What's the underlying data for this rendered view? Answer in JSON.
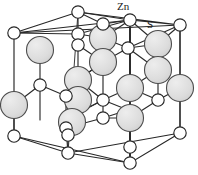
{
  "figure": {
    "name": "zinc-sulfide-wurtzite-unit-cell",
    "labels": {
      "cation": "Zn",
      "anion": "S"
    },
    "colors": {
      "edge": "#262626",
      "anion_fill": "#ffffff",
      "anion_stroke": "#262626",
      "cation_fill": "#d9d9d9",
      "cation_stroke": "#4d4d4d",
      "background": "#ffffff"
    },
    "geometry": {
      "anion_radius": 6.2,
      "cation_radius": 13.5,
      "cell_corners": {
        "top_back_left": [
          78,
          12
        ],
        "top_back_right": [
          130,
          20
        ],
        "top_front_left": [
          14,
          33
        ],
        "top_front_right": [
          180,
          25
        ],
        "bottom_back_left": [
          68,
          153
        ],
        "bottom_back_right": [
          130,
          163
        ],
        "bottom_front_left": [
          14,
          136
        ],
        "bottom_front_right": [
          180,
          133
        ]
      }
    },
    "structure_type": "hexagonal wurtzite unit cell outline with tetrahedrally bonded Zn and S sites"
  }
}
